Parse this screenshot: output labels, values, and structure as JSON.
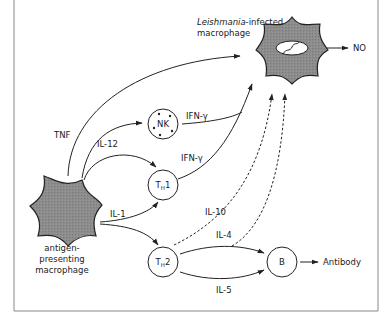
{
  "diagram": {
    "title_label": {
      "italic": "Leishmania",
      "rest_line1": "-infected",
      "line2": "macrophage"
    },
    "nodes": {
      "infected_macrophage": {
        "label": "Leishmania-infected macrophage"
      },
      "apc": {
        "line1": "antigen-",
        "line2": "presenting",
        "line3": "macrophage"
      },
      "nk": {
        "label": "NK"
      },
      "th1": {
        "main": "T",
        "sub": "H",
        "suffix": "1"
      },
      "th2": {
        "main": "T",
        "sub": "H",
        "suffix": "2"
      },
      "b": {
        "label": "B"
      }
    },
    "outputs": {
      "no": "NO",
      "antibody": "Antibody"
    },
    "edge_labels": {
      "tnf": "TNF",
      "il12": "IL-12",
      "ifn_nk": "IFN-γ",
      "ifn_th1": "IFN-γ",
      "il10": "IL-10",
      "il1": "IL-1",
      "il4": "IL-4",
      "il5": "IL-5"
    },
    "colors": {
      "cell_fill": "#8a8a8a",
      "line": "#222222",
      "frame": "#888888"
    }
  }
}
